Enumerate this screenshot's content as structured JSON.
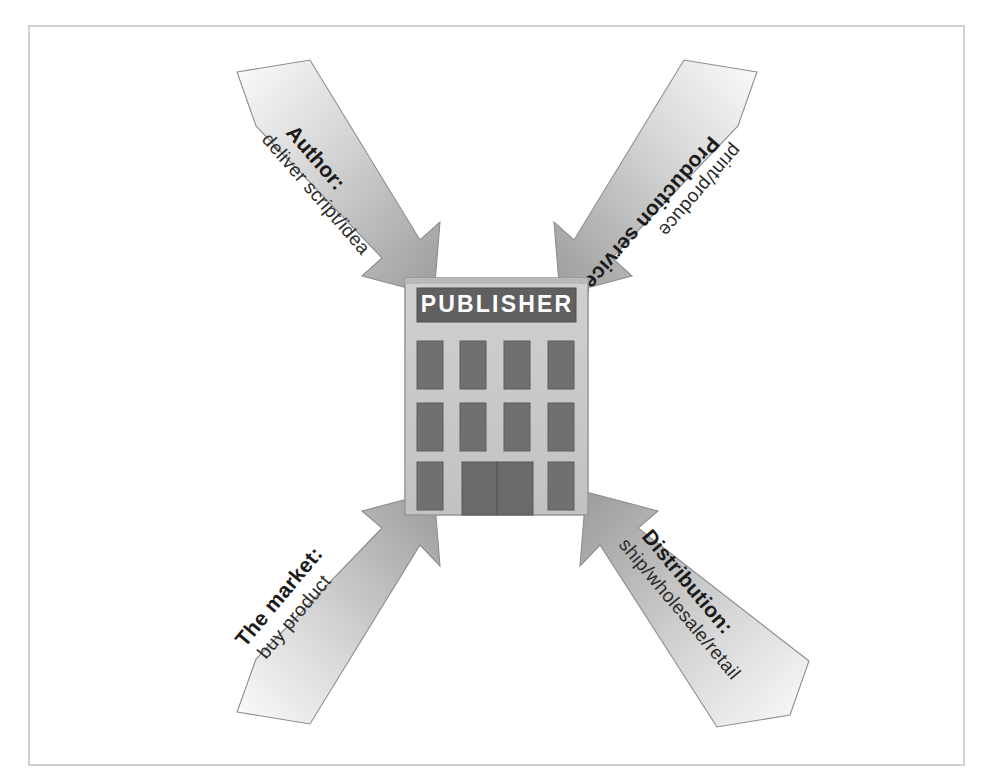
{
  "figure": {
    "frame_color": "#d2d2d2",
    "background": "#ffffff"
  },
  "building": {
    "sign_label": "PUBLISHER",
    "sign_fill": "#606060",
    "sign_text_color": "#ffffff",
    "wall_fill": "#c8c8c8",
    "wall_edge": "#9a9a9a",
    "window_fill": "#707070",
    "door_fill": "#6a6a6a",
    "window_rows": 3,
    "windows_per_row": 4
  },
  "arrows": [
    {
      "id": "author",
      "title": "Author:",
      "subtitle": "deliver script/idea",
      "direction": "down-right",
      "position": "top-left",
      "points_to": "publisher",
      "fill_light": "#f2f2f2",
      "fill_dark": "#9b9b9b"
    },
    {
      "id": "production-services",
      "title": "Production services:",
      "subtitle": "print/produce",
      "direction": "down-left",
      "position": "top-right",
      "points_to": "publisher",
      "fill_light": "#f2f2f2",
      "fill_dark": "#9b9b9b"
    },
    {
      "id": "the-market",
      "title": "The market:",
      "subtitle": "buy product",
      "direction": "up-right",
      "position": "bottom-left",
      "points_to": "publisher",
      "fill_light": "#f2f2f2",
      "fill_dark": "#9b9b9b"
    },
    {
      "id": "distribution",
      "title": "Distribution:",
      "subtitle": "ship/wholesale/retail",
      "direction": "up-left",
      "position": "bottom-right",
      "points_to": "publisher",
      "fill_light": "#f2f2f2",
      "fill_dark": "#9b9b9b"
    }
  ]
}
